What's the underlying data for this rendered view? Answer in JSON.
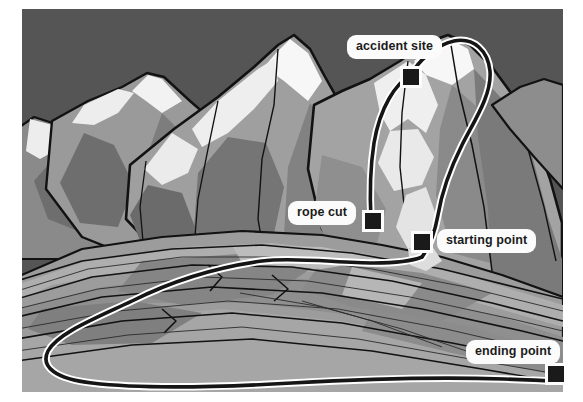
{
  "image": {
    "kind": "illustrated-mountain-route-map",
    "description": "Grayscale illustration of a mountain range with a marked climbing route",
    "frame": {
      "background": "#ffffff",
      "sky_color": "#555555"
    }
  },
  "palette": {
    "sky": "#555555",
    "rock_dark": "#5f5f5f",
    "rock_mid_dark": "#6e6e6e",
    "rock_mid": "#808080",
    "rock_light": "#949494",
    "rock_lighter": "#a8a8a8",
    "rock_pale": "#bcbcbc",
    "snow": "#ededed",
    "snow_bright": "#f7f7f7",
    "outline": "#121212",
    "route_core": "#151515",
    "route_casing": "#ffffff",
    "label_bg": "#fbfbfb",
    "label_text": "#1b1b1b",
    "marker_fill": "#1a1a1a",
    "marker_border": "#fdfdfd"
  },
  "route": {
    "name": "climbing-route",
    "style": "black line with white casing",
    "waypoints": [
      {
        "id": "accident-site",
        "label": "accident site",
        "x": 411,
        "y": 76,
        "label_x": 347,
        "label_y": 35
      },
      {
        "id": "rope-cut",
        "label": "rope cut",
        "x": 370,
        "y": 220,
        "label_x": 288,
        "label_y": 201
      },
      {
        "id": "starting-point",
        "label": "starting point",
        "x": 420,
        "y": 240,
        "label_x": 437,
        "label_y": 229
      },
      {
        "id": "ending-point",
        "label": "ending point",
        "x": 556,
        "y": 372,
        "label_x": 466,
        "label_y": 340
      }
    ]
  },
  "markers": {
    "accident_site": {
      "label": "accident site"
    },
    "rope_cut": {
      "label": "rope cut"
    },
    "starting_point": {
      "label": "starting point"
    },
    "ending_point": {
      "label": "ending point"
    }
  }
}
